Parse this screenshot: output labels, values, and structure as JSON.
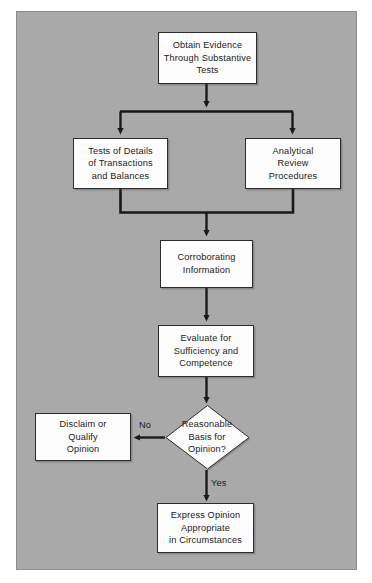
{
  "diagram": {
    "background_color": "#a9a9a9",
    "node_fill": "#fdfdfd",
    "line_color": "#1a1a1a",
    "nodes": [
      {
        "id": "obtain-evidence",
        "shape": "process",
        "text": "Obtain Evidence\nThrough Substantive\nTests"
      },
      {
        "id": "tests-of-details",
        "shape": "process",
        "text": "Tests of Details\nof Transactions\nand Balances"
      },
      {
        "id": "analytical-review",
        "shape": "process",
        "text": "Analytical\nReview\nProcedures"
      },
      {
        "id": "corroborating-information",
        "shape": "process",
        "text": "Corroborating\nInformation"
      },
      {
        "id": "evaluate-sufficiency",
        "shape": "process",
        "text": "Evaluate for\nSufficiency and\nCompetence"
      },
      {
        "id": "reasonable-basis",
        "shape": "decision",
        "text": "Reasonable\nBasis for\nOpinion?"
      },
      {
        "id": "disclaim-or-qualify",
        "shape": "process",
        "text": "Disclaim or\nQualify\nOpinion"
      },
      {
        "id": "express-opinion",
        "shape": "process",
        "text": "Express Opinion\nAppropriate\nin Circumstances"
      }
    ],
    "edge_labels": [
      {
        "id": "no-label",
        "text": "No"
      },
      {
        "id": "yes-label",
        "text": "Yes"
      }
    ]
  }
}
